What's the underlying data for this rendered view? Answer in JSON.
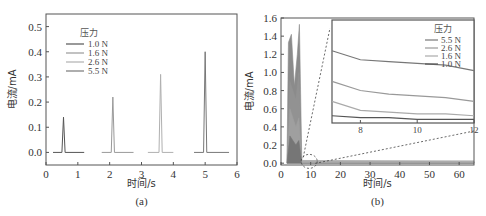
{
  "chart_data": [
    {
      "id": "a",
      "type": "line",
      "title": "",
      "caption": "(a)",
      "xlabel": "时间/s",
      "ylabel": "电流/mA",
      "xlim": [
        0,
        6
      ],
      "ylim": [
        -0.05,
        0.55
      ],
      "xticks": [
        "0",
        "1",
        "2",
        "3",
        "4",
        "5",
        "6"
      ],
      "yticks": [
        "0.0",
        "0.1",
        "0.2",
        "0.3",
        "0.4",
        "0.5"
      ],
      "grid": false,
      "legend": {
        "title": "压力",
        "position": "upper-left",
        "entries": [
          "1.0 N",
          "1.6 N",
          "2.6 N",
          "5.5 N"
        ]
      },
      "series": [
        {
          "name": "1.0 N",
          "color": "#555555",
          "x": [
            0.22,
            0.5,
            0.55,
            0.6,
            1.2
          ],
          "y": [
            0.0,
            0.0,
            0.14,
            0.0,
            0.0
          ]
        },
        {
          "name": "1.6 N",
          "color": "#999999",
          "x": [
            1.75,
            2.05,
            2.1,
            2.15,
            2.75
          ],
          "y": [
            0.0,
            0.0,
            0.22,
            0.0,
            0.0
          ]
        },
        {
          "name": "2.6 N",
          "color": "#b0b0b0",
          "x": [
            3.2,
            3.55,
            3.6,
            3.65,
            4.0
          ],
          "y": [
            0.0,
            0.0,
            0.31,
            0.0,
            0.0
          ]
        },
        {
          "name": "5.5 N",
          "color": "#777777",
          "x": [
            4.65,
            4.95,
            5.0,
            5.05,
            5.75
          ],
          "y": [
            0.0,
            0.0,
            0.4,
            0.0,
            0.0
          ]
        }
      ]
    },
    {
      "id": "b",
      "type": "line",
      "title": "",
      "caption": "(b)",
      "xlabel": "时间/s",
      "ylabel": "电流/mA",
      "xlim": [
        0,
        65
      ],
      "ylim": [
        -0.02,
        1.6
      ],
      "xticks": [
        "0",
        "10",
        "20",
        "30",
        "40",
        "50",
        "60"
      ],
      "yticks": [
        "0.0",
        "0.2",
        "0.4",
        "0.6",
        "0.8",
        "1.0",
        "1.2",
        "1.4",
        "1.6"
      ],
      "grid": false,
      "series": [
        {
          "name": "5.5 N",
          "color": "#777777",
          "x": [
            2,
            2.5,
            3.5,
            4.5,
            5.5,
            6.2,
            7,
            65
          ],
          "y": [
            0.0,
            1.33,
            1.42,
            0.85,
            1.2,
            1.53,
            0.03,
            0.02
          ]
        },
        {
          "name": "2.6 N",
          "color": "#999999",
          "x": [
            2,
            3,
            5,
            6,
            7,
            65
          ],
          "y": [
            0.0,
            0.9,
            0.7,
            1.0,
            0.02,
            0.015
          ]
        },
        {
          "name": "1.6 N",
          "color": "#aaaaaa",
          "x": [
            2,
            3,
            5,
            6,
            7,
            65
          ],
          "y": [
            0.0,
            0.6,
            0.4,
            0.5,
            0.01,
            0.01
          ]
        },
        {
          "name": "1.0 N",
          "color": "#555555",
          "x": [
            2,
            3,
            5,
            6,
            7,
            65
          ],
          "y": [
            0.0,
            0.3,
            0.2,
            0.25,
            0.005,
            0.005
          ]
        }
      ],
      "annotations": [
        "dashed circle around t≈7–12 s near 0 mA with dashed zoom lines to inset"
      ],
      "inset": {
        "type": "line",
        "xlim": [
          7,
          12
        ],
        "xticks": [
          "8",
          "10",
          "12"
        ],
        "legend": {
          "title": "压力",
          "position": "upper-right",
          "entries": [
            "5.5 N",
            "2.6 N",
            "1.6 N",
            "1.0 N"
          ]
        },
        "series": [
          {
            "name": "5.5 N",
            "color": "#777777",
            "x": [
              7,
              8,
              9,
              10,
              11,
              12
            ],
            "y": [
              0.83,
              0.78,
              0.77,
              0.76,
              0.75,
              0.72
            ]
          },
          {
            "name": "2.6 N",
            "color": "#999999",
            "x": [
              7,
              8,
              9,
              10,
              11,
              12
            ],
            "y": [
              0.66,
              0.61,
              0.59,
              0.58,
              0.57,
              0.55
            ]
          },
          {
            "name": "1.6 N",
            "color": "#aaaaaa",
            "x": [
              7,
              8,
              9,
              10,
              11,
              12
            ],
            "y": [
              0.55,
              0.5,
              0.49,
              0.48,
              0.48,
              0.47
            ]
          },
          {
            "name": "1.0 N",
            "color": "#555555",
            "x": [
              7,
              8,
              9,
              10,
              11,
              12
            ],
            "y": [
              0.47,
              0.46,
              0.46,
              0.45,
              0.45,
              0.45
            ]
          }
        ]
      }
    }
  ]
}
